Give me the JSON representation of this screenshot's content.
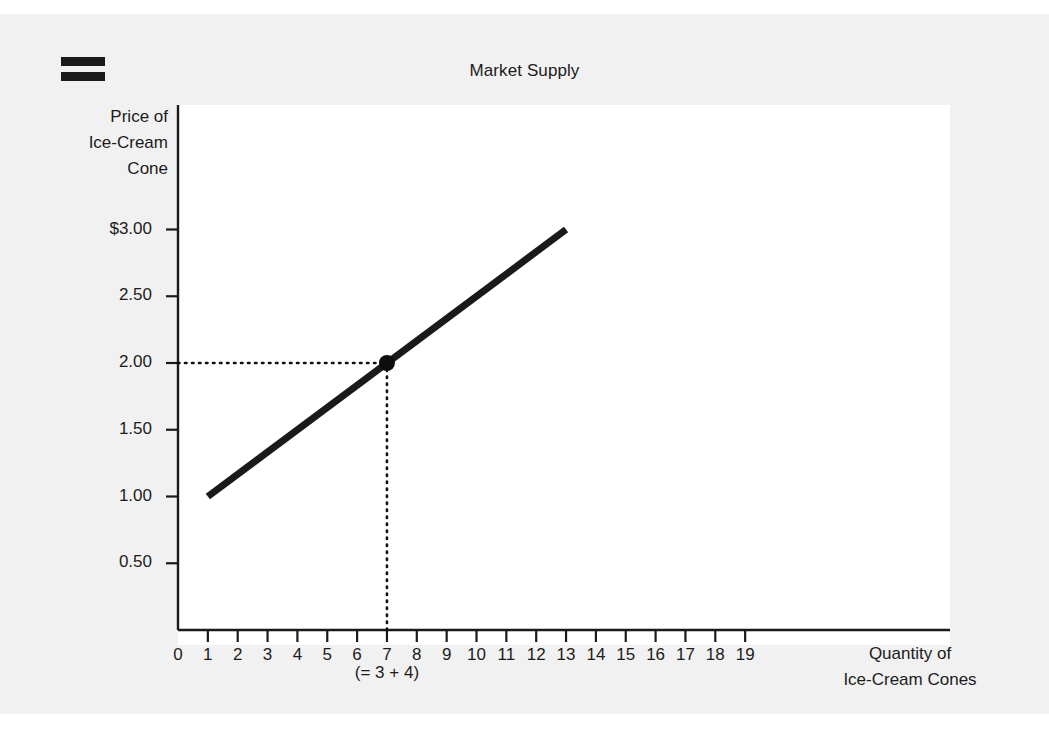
{
  "toolbar": {
    "menu_icon": "equals-menu-icon"
  },
  "chart_data": {
    "type": "line",
    "title": "Market Supply",
    "xlabel": "Quantity of Ice-Cream Cones",
    "xlabel_lines": [
      "Quantity of",
      "Ice-Cream Cones"
    ],
    "ylabel": "Price of Ice-Cream Cone",
    "ylabel_lines": [
      "Price of",
      "Ice-Cream",
      "Cone"
    ],
    "xlim": [
      0,
      19.6
    ],
    "ylim": [
      0,
      3.25
    ],
    "grid": false,
    "legend": null,
    "x_ticks": [
      0,
      1,
      2,
      3,
      4,
      5,
      6,
      7,
      8,
      9,
      10,
      11,
      12,
      13,
      14,
      15,
      16,
      17,
      18,
      19
    ],
    "x_tick_labels": [
      "0",
      "1",
      "2",
      "3",
      "4",
      "5",
      "6",
      "7",
      "8",
      "9",
      "10",
      "11",
      "12",
      "13",
      "14",
      "15",
      "16",
      "17",
      "18",
      "19"
    ],
    "y_ticks": [
      0.5,
      1.0,
      1.5,
      2.0,
      2.5,
      3.0
    ],
    "y_tick_labels": [
      "0.50",
      "1.00",
      "1.50",
      "2.00",
      "2.50",
      "$3.00"
    ],
    "series": [
      {
        "name": "Supply",
        "type": "line",
        "color": "#1a1a1a",
        "linewidth": 7,
        "x": [
          1,
          13
        ],
        "y": [
          1.0,
          3.0
        ]
      }
    ],
    "points": [
      {
        "name": "market-quantity-point",
        "x": 7,
        "y": 2.0,
        "color": "#0d0d0d",
        "radius": 8
      }
    ],
    "annotations": [
      {
        "name": "sum-note",
        "text": "(= 3 + 4)",
        "x": 7,
        "y": -0.33
      }
    ],
    "guides": [
      {
        "name": "price-guide",
        "orientation": "horizontal",
        "value": 2.0,
        "from": 0,
        "to": 7,
        "style": "dotted"
      },
      {
        "name": "quantity-guide",
        "orientation": "vertical",
        "value": 7,
        "from": 0,
        "to": 2.0,
        "style": "dotted"
      }
    ]
  }
}
